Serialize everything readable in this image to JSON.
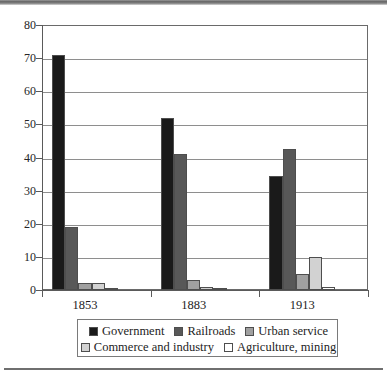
{
  "chart_data": {
    "type": "bar",
    "title": "",
    "subtitle": "",
    "xlabel": "",
    "ylabel": "",
    "categories": [
      "1853",
      "1883",
      "1913"
    ],
    "series": [
      {
        "name": "Government",
        "color": "#1a1a1a",
        "values": [
          71,
          52,
          34.5
        ]
      },
      {
        "name": "Railroads",
        "color": "#585858",
        "values": [
          19,
          41,
          42.5
        ]
      },
      {
        "name": "Urban service",
        "color": "#a0a0a0",
        "values": [
          2,
          3,
          4.7
        ]
      },
      {
        "name": "Commerce and industry",
        "color": "#d2d2d2",
        "values": [
          2,
          0.8,
          10
        ]
      },
      {
        "name": "Agriculture, mining",
        "color": "#ffffff",
        "values": [
          0.7,
          0.4,
          0.8
        ]
      }
    ],
    "ylim": [
      0,
      80
    ],
    "ytick_values": [
      0,
      10,
      20,
      30,
      40,
      50,
      60,
      70,
      80
    ],
    "ytick_labels": [
      "0",
      "10",
      "20",
      "30",
      "40",
      "50",
      "60",
      "70",
      "80"
    ],
    "grid": true,
    "legend_position": "bottom",
    "legend_rows": [
      [
        "Government",
        "Railroads",
        "Urban service"
      ],
      [
        "Commerce and industry",
        "Agriculture, mining"
      ]
    ]
  }
}
